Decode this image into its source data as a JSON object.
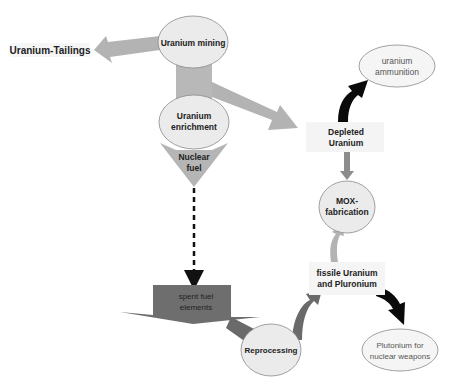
{
  "diagram": {
    "nodes": {
      "tailings": {
        "label": "Uranium-Tailings"
      },
      "mining": {
        "label": "Uranium mining"
      },
      "enrichment": {
        "line1": "Uranium",
        "line2": "enrichment"
      },
      "fuel": {
        "line1": "Nuclear",
        "line2": "fuel"
      },
      "spent": {
        "line1": "spent fuel",
        "line2": "elements"
      },
      "reprocessing": {
        "label": "Reprocessing"
      },
      "fissile": {
        "line1": "fissile Uranium",
        "line2": "and Pluronium"
      },
      "mox": {
        "line1": "MOX-",
        "line2": "fabrication"
      },
      "depleted": {
        "line1": "Depleted",
        "line2": "Uranium"
      },
      "ammunition": {
        "line1": "uranium",
        "line2": "ammunition"
      },
      "plutonium": {
        "line1": "Plutonium for",
        "line2": "nuclear weapons"
      }
    },
    "colors": {
      "light_arrow": "#b3b3b3",
      "mid_arrow": "#8c8c8c",
      "dark_arrow": "#666666",
      "black_arrow": "#0a0a0a",
      "node_fill": "#ebebeb",
      "node_stroke": "#8a8a8a",
      "spent_fill": "#6e6e6e"
    }
  }
}
